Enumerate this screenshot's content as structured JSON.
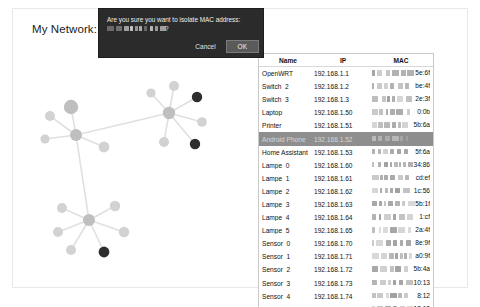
{
  "page": {
    "title": "My Network:"
  },
  "dialog": {
    "message_prefix": "Are you sure you want to isolate MAC address:",
    "message_suffix": "?",
    "mac_redacted": "██:██:██:██:██:██",
    "cancel_label": "Cancel",
    "ok_label": "OK"
  },
  "table": {
    "columns": [
      "Name",
      "IP",
      "MAC"
    ],
    "selected_index": 5,
    "rows": [
      {
        "name": "OpenWRT",
        "ip": "192.168.1.1",
        "mac_tail": "5e:6f"
      },
      {
        "name": "Switch_2",
        "ip": "192.168.1.2",
        "mac_tail": "be:4f"
      },
      {
        "name": "Switch_3",
        "ip": "192.168.1.3",
        "mac_tail": "2e:3f"
      },
      {
        "name": "Laptop",
        "ip": "192.168.1.50",
        "mac_tail": "0:0b"
      },
      {
        "name": "Printer",
        "ip": "192.168.1.51",
        "mac_tail": "5b:6a"
      },
      {
        "name": "Android Phone",
        "ip": "192.168.1.52",
        "mac_tail": ""
      },
      {
        "name": "Home Assistant",
        "ip": "192.168.1.53",
        "mac_tail": "5f:6a"
      },
      {
        "name": "Lampe_0",
        "ip": "192.168.1.60",
        "mac_tail": "34:86"
      },
      {
        "name": "Lampe_1",
        "ip": "192.168.1.61",
        "mac_tail": "cd:ef"
      },
      {
        "name": "Lampe_2",
        "ip": "192.168.1.62",
        "mac_tail": "1c:56"
      },
      {
        "name": "Lampe_3",
        "ip": "192.168.1.63",
        "mac_tail": "5b:1f"
      },
      {
        "name": "Lampe_4",
        "ip": "192.168.1.64",
        "mac_tail": "1:cf"
      },
      {
        "name": "Lampe_5",
        "ip": "192.168.1.65",
        "mac_tail": "2a:4f"
      },
      {
        "name": "Sensor_0",
        "ip": "192.168.1.70",
        "mac_tail": "8e:9f"
      },
      {
        "name": "Sensor_1",
        "ip": "192.168.1.71",
        "mac_tail": "a0:9f"
      },
      {
        "name": "Sensor_2",
        "ip": "192.168.1.72",
        "mac_tail": "5b:4a"
      },
      {
        "name": "Sensor_3",
        "ip": "192.168.1.73",
        "mac_tail": "10:13"
      },
      {
        "name": "Sensor_4",
        "ip": "192.168.1.74",
        "mac_tail": "8:12"
      },
      {
        "name": "Sensor_5",
        "ip": "192.168.1.75",
        "mac_tail": "18:13"
      }
    ]
  },
  "graph": {
    "colors": {
      "node_light": "#d2d2d2",
      "node_mid": "#bfbfbf",
      "node_dark": "#2e2e2e",
      "edge": "#e0e0e0"
    },
    "nodes": [
      {
        "id": "hub_left",
        "x": 62,
        "y": 75,
        "r": 6.0,
        "shade": "mid"
      },
      {
        "id": "n_l1",
        "x": 57,
        "y": 47,
        "r": 7.2,
        "shade": "mid"
      },
      {
        "id": "n_l2",
        "x": 36,
        "y": 56,
        "r": 5.0,
        "shade": "light"
      },
      {
        "id": "n_l3",
        "x": 31,
        "y": 79,
        "r": 4.6,
        "shade": "light"
      },
      {
        "id": "n_l4",
        "x": 90,
        "y": 87,
        "r": 5.4,
        "shade": "light"
      },
      {
        "id": "hub_right",
        "x": 155,
        "y": 53,
        "r": 6.2,
        "shade": "mid"
      },
      {
        "id": "n_r1",
        "x": 137,
        "y": 33,
        "r": 4.6,
        "shade": "light"
      },
      {
        "id": "n_r2",
        "x": 160,
        "y": 26,
        "r": 5.0,
        "shade": "light"
      },
      {
        "id": "n_r3",
        "x": 183,
        "y": 37,
        "r": 5.2,
        "shade": "dark"
      },
      {
        "id": "n_r4",
        "x": 188,
        "y": 62,
        "r": 4.8,
        "shade": "light"
      },
      {
        "id": "n_r5",
        "x": 181,
        "y": 84,
        "r": 5.2,
        "shade": "dark"
      },
      {
        "id": "n_r6",
        "x": 150,
        "y": 82,
        "r": 5.0,
        "shade": "light"
      },
      {
        "id": "hub_bot",
        "x": 75,
        "y": 160,
        "r": 6.0,
        "shade": "mid"
      },
      {
        "id": "n_b1",
        "x": 48,
        "y": 148,
        "r": 5.0,
        "shade": "light"
      },
      {
        "id": "n_b2",
        "x": 44,
        "y": 172,
        "r": 5.0,
        "shade": "light"
      },
      {
        "id": "n_b3",
        "x": 57,
        "y": 190,
        "r": 5.0,
        "shade": "light"
      },
      {
        "id": "n_b4",
        "x": 101,
        "y": 146,
        "r": 5.2,
        "shade": "light"
      },
      {
        "id": "n_b5",
        "x": 110,
        "y": 172,
        "r": 5.2,
        "shade": "light"
      },
      {
        "id": "n_b6",
        "x": 90,
        "y": 192,
        "r": 5.4,
        "shade": "dark"
      }
    ],
    "edges": [
      [
        "hub_left",
        "n_l1"
      ],
      [
        "hub_left",
        "n_l2"
      ],
      [
        "hub_left",
        "n_l3"
      ],
      [
        "hub_left",
        "n_l4"
      ],
      [
        "hub_left",
        "hub_right"
      ],
      [
        "hub_left",
        "hub_bot"
      ],
      [
        "hub_right",
        "n_r1"
      ],
      [
        "hub_right",
        "n_r2"
      ],
      [
        "hub_right",
        "n_r3"
      ],
      [
        "hub_right",
        "n_r4"
      ],
      [
        "hub_right",
        "n_r5"
      ],
      [
        "hub_right",
        "n_r6"
      ],
      [
        "hub_bot",
        "n_b1"
      ],
      [
        "hub_bot",
        "n_b2"
      ],
      [
        "hub_bot",
        "n_b3"
      ],
      [
        "hub_bot",
        "n_b4"
      ],
      [
        "hub_bot",
        "n_b5"
      ],
      [
        "hub_bot",
        "n_b6"
      ]
    ]
  }
}
